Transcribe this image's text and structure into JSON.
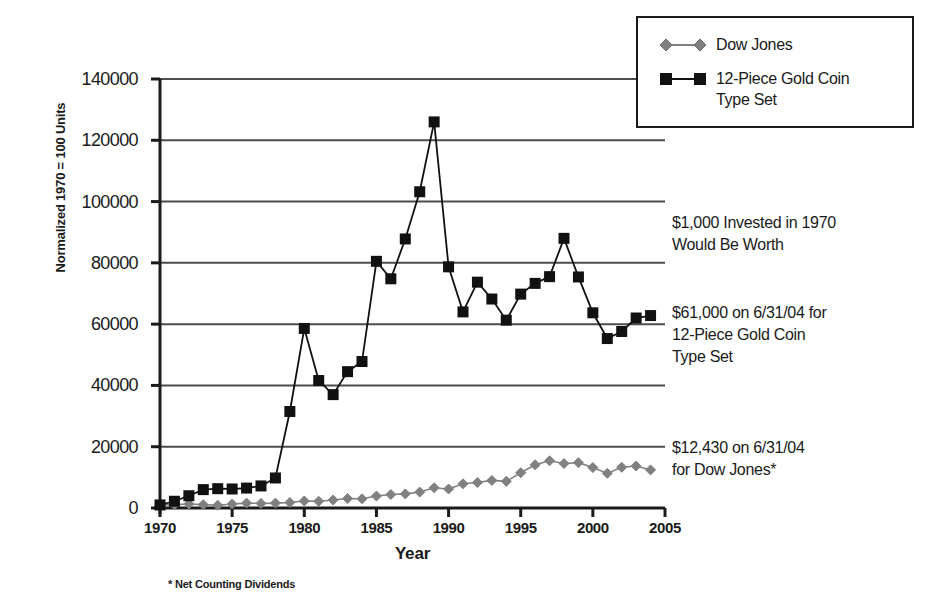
{
  "chart_data": {
    "type": "line",
    "title": "",
    "xlabel": "Year",
    "ylabel": "Normalized 1970 = 100 Units",
    "xlim": [
      1970,
      2005
    ],
    "ylim": [
      0,
      140000
    ],
    "xticks": [
      "1970",
      "1975",
      "1980",
      "1985",
      "1990",
      "1995",
      "2000",
      "2005"
    ],
    "xtick_values": [
      1970,
      1975,
      1980,
      1985,
      1990,
      1995,
      2000,
      2005
    ],
    "yticks": [
      "0",
      "20000",
      "40000",
      "60000",
      "80000",
      "100000",
      "120000",
      "140000"
    ],
    "ytick_values": [
      0,
      20000,
      40000,
      60000,
      80000,
      100000,
      120000,
      140000
    ],
    "grid": "horizontal",
    "legend_position": "top-right",
    "x": [
      1970,
      1971,
      1972,
      1973,
      1974,
      1975,
      1976,
      1977,
      1978,
      1979,
      1980,
      1981,
      1982,
      1983,
      1984,
      1985,
      1986,
      1987,
      1988,
      1989,
      1990,
      1991,
      1992,
      1993,
      1994,
      1995,
      1996,
      1997,
      1998,
      1999,
      2000,
      2001,
      2002,
      2003,
      2004
    ],
    "series": [
      {
        "name": "Dow Jones",
        "marker": "diamond",
        "color": "#808080",
        "values": [
          1000,
          1100,
          1300,
          1100,
          900,
          1300,
          1600,
          1500,
          1600,
          1800,
          2300,
          2200,
          2600,
          3100,
          3000,
          3900,
          4400,
          4600,
          5200,
          6600,
          6200,
          7900,
          8300,
          9000,
          8700,
          11500,
          14100,
          15400,
          14500,
          14800,
          13200,
          11300,
          13300,
          13700,
          12430
        ]
      },
      {
        "name": "12-Piece Gold Coin\nType Set",
        "marker": "square",
        "color": "#111111",
        "values": [
          1000,
          2200,
          4000,
          6000,
          6300,
          6200,
          6500,
          7200,
          9800,
          31500,
          58600,
          41600,
          37000,
          44500,
          47800,
          80500,
          74800,
          87800,
          103200,
          126000,
          78700,
          64000,
          73700,
          68200,
          61300,
          69800,
          73300,
          75500,
          88000,
          75400,
          63700,
          55300,
          57600,
          62000,
          62800
        ]
      }
    ],
    "annotations": [
      "$1,000 Invested in 1970\nWould Be Worth",
      "$61,000 on 6/31/04 for\n12-Piece Gold Coin\nType Set",
      "$12,430 on 6/31/04\nfor Dow Jones*"
    ],
    "footnote": "* Net Counting Dividends"
  },
  "legend": {
    "items": [
      {
        "label": "Dow Jones",
        "marker": "diamond-marker",
        "color": "#808080"
      },
      {
        "label": "12-Piece Gold Coin\nType Set",
        "marker": "square-marker",
        "color": "#111111"
      }
    ]
  },
  "colors": {
    "dow_jones": "#808080",
    "gold_coin": "#111111",
    "axis": "#1a1a1a",
    "grid": "#4d4d4d",
    "background": "#ffffff"
  }
}
